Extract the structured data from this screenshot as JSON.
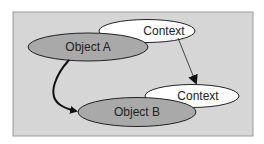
{
  "diagram": {
    "background": "#ffffff",
    "panel_fill": "#d6d6d6",
    "panel_stroke": "#9a9a9a",
    "nodes": [
      {
        "id": "context-top",
        "label": "Context",
        "fill": "#ffffff"
      },
      {
        "id": "object-a",
        "label": "Object A",
        "fill": "#a9a9a9"
      },
      {
        "id": "context-bottom",
        "label": "Context",
        "fill": "#ffffff"
      },
      {
        "id": "object-b",
        "label": "Object B",
        "fill": "#a9a9a9"
      }
    ],
    "edges": [
      {
        "from": "object-a",
        "to": "object-b",
        "style": "thick curved"
      },
      {
        "from": "context-top",
        "to": "context-bottom",
        "style": "thin straight"
      }
    ]
  }
}
